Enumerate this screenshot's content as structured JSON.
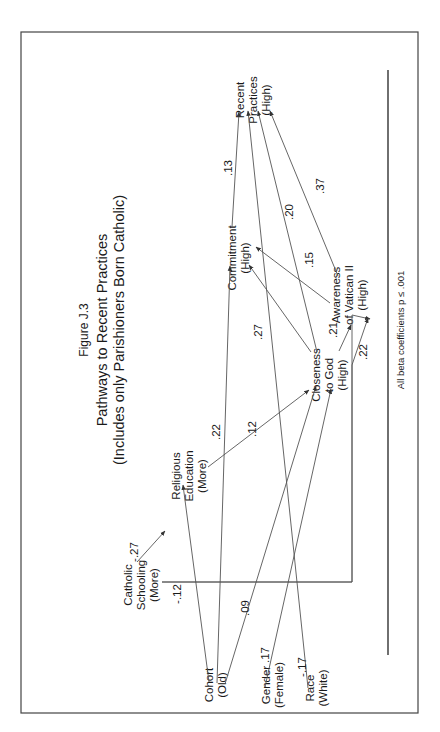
{
  "figure": {
    "label": "Figure J.3",
    "title": "Pathways to Recent Practices",
    "subtitle": "(Includes only Parishioners Born Catholic)",
    "footnote": "All beta coefficients p ≤ .001",
    "orientation": "rotated 90 degrees counter-clockwise"
  },
  "nodes": {
    "cohort": [
      "Cohort",
      "(Old)"
    ],
    "gender": [
      "Gender",
      "(Female)"
    ],
    "race": [
      "Race",
      "(White)"
    ],
    "catholic_schooling": [
      "Catholic",
      "Schooling",
      "(More)"
    ],
    "religious_education": [
      "Religious",
      "Education",
      "(More)"
    ],
    "closeness": [
      "Closeness",
      "to God",
      "(High)"
    ],
    "awareness": [
      "Awareness",
      "of Vatican II",
      "(High)"
    ],
    "commitment": [
      "Commitment",
      "(High)"
    ],
    "recent_practices": [
      "Recent",
      "Practices",
      "(High)"
    ]
  },
  "paths": [
    {
      "from": "Catholic Schooling",
      "to": "Religious Education",
      "beta": "-.27"
    },
    {
      "from": "Catholic Schooling",
      "to": "Awareness of Vatican II",
      "beta": ".22"
    },
    {
      "from": "Cohort",
      "to": "Religious Education",
      "beta": "-.12"
    },
    {
      "from": "Cohort",
      "to": "Commitment",
      "beta": ".22"
    },
    {
      "from": "Cohort",
      "to": "Closeness to God",
      "beta": ".09"
    },
    {
      "from": "Gender",
      "to": "Closeness to God",
      "beta": ".17"
    },
    {
      "from": "Race",
      "to": "Recent Practices",
      "beta": "-.17"
    },
    {
      "from": "Religious Education",
      "to": "Closeness to God",
      "beta": ".12"
    },
    {
      "from": "Closeness to God",
      "to": "Commitment",
      "beta": ".27"
    },
    {
      "from": "Closeness to God",
      "to": "Awareness of Vatican II",
      "beta": ".21"
    },
    {
      "from": "Closeness to God",
      "to": "Recent Practices",
      "beta": ".20"
    },
    {
      "from": "Awareness of Vatican II",
      "to": "Commitment",
      "beta": ".15"
    },
    {
      "from": "Awareness of Vatican II",
      "to": "Recent Practices",
      "beta": ".37"
    },
    {
      "from": "Commitment",
      "to": "Recent Practices",
      "beta": ".13"
    }
  ],
  "coef_labels": {
    "cs_re": "-.27",
    "cs_aw": ".22",
    "co_re": "-.12",
    "co_cm": ".22",
    "co_cl": ".09",
    "ge_cl": ".17",
    "ra_rp": "-.17",
    "re_cl": ".12",
    "cl_cm": ".27",
    "cl_aw": ".21",
    "cl_rp": ".20",
    "aw_cm": ".15",
    "aw_rp": ".37",
    "cm_rp": ".13"
  }
}
